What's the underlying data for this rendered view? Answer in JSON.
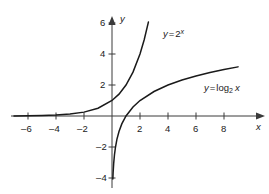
{
  "chart_data": {
    "type": "line",
    "title": "",
    "subtitle": "",
    "xlabel": "x",
    "ylabel": "y",
    "xlim": [
      -7.2,
      9.6
    ],
    "ylim": [
      -4.6,
      6.6
    ],
    "grid": false,
    "legend_position": "inline-annotations",
    "x_ticks": [
      -6,
      -4,
      -2,
      2,
      4,
      6,
      8
    ],
    "x_tick_labels": [
      "–6",
      "–4",
      "–2",
      "2",
      "4",
      "6",
      "8"
    ],
    "y_ticks": [
      -4,
      -2,
      2,
      4,
      6
    ],
    "y_tick_labels": [
      "–4",
      "–2",
      "2",
      "4",
      "6"
    ],
    "series": [
      {
        "name": "y = 2^x",
        "expression": "y = 2^x",
        "color": "#1a1a1a",
        "points": [
          {
            "x": -7.0,
            "y": 0.008
          },
          {
            "x": -6.0,
            "y": 0.016
          },
          {
            "x": -5.0,
            "y": 0.031
          },
          {
            "x": -4.0,
            "y": 0.063
          },
          {
            "x": -3.0,
            "y": 0.125
          },
          {
            "x": -2.0,
            "y": 0.25
          },
          {
            "x": -1.0,
            "y": 0.5
          },
          {
            "x": 0.0,
            "y": 1.0
          },
          {
            "x": 0.5,
            "y": 1.41
          },
          {
            "x": 1.0,
            "y": 2.0
          },
          {
            "x": 1.5,
            "y": 2.83
          },
          {
            "x": 2.0,
            "y": 4.0
          },
          {
            "x": 2.3,
            "y": 4.92
          },
          {
            "x": 2.6,
            "y": 6.06
          }
        ]
      },
      {
        "name": "y = log2 x",
        "expression": "y = log_2 x",
        "color": "#1a1a1a",
        "points": [
          {
            "x": 0.06,
            "y": -4.06
          },
          {
            "x": 0.08,
            "y": -3.64
          },
          {
            "x": 0.12,
            "y": -3.06
          },
          {
            "x": 0.18,
            "y": -2.47
          },
          {
            "x": 0.25,
            "y": -2.0
          },
          {
            "x": 0.35,
            "y": -1.51
          },
          {
            "x": 0.5,
            "y": -1.0
          },
          {
            "x": 0.7,
            "y": -0.51
          },
          {
            "x": 1.0,
            "y": 0.0
          },
          {
            "x": 1.5,
            "y": 0.58
          },
          {
            "x": 2.0,
            "y": 1.0
          },
          {
            "x": 3.0,
            "y": 1.58
          },
          {
            "x": 4.0,
            "y": 2.0
          },
          {
            "x": 5.0,
            "y": 2.32
          },
          {
            "x": 6.0,
            "y": 2.58
          },
          {
            "x": 7.0,
            "y": 2.81
          },
          {
            "x": 8.0,
            "y": 3.0
          },
          {
            "x": 9.0,
            "y": 3.17
          }
        ]
      }
    ],
    "annotations": [
      {
        "text": "y = 2^x",
        "x": 2.9,
        "y": 5.0
      },
      {
        "text": "y = log_2 x",
        "x": 5.6,
        "y": 2.55
      }
    ]
  },
  "axes": {
    "x_axis_label": "x",
    "y_axis_label": "y",
    "x_tick_labels": [
      "–6",
      "–4",
      "–2",
      "2",
      "4",
      "6",
      "8"
    ],
    "y_tick_labels": [
      "6",
      "4",
      "2",
      "–2",
      "–4"
    ]
  },
  "labels": {
    "exponential": {
      "lhs": "y",
      "equals": "=",
      "base": "2",
      "exponent": "x"
    },
    "logarithmic": {
      "lhs": "y",
      "equals": "=",
      "fn": "log",
      "base": "2",
      "arg": "x"
    }
  }
}
